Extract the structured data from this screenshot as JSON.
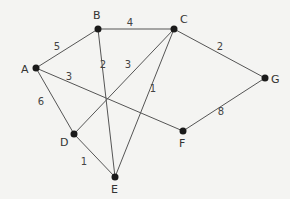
{
  "graph": {
    "nodes": [
      {
        "id": "A",
        "x": 36,
        "y": 68,
        "lx": 21,
        "ly": 73
      },
      {
        "id": "B",
        "x": 98,
        "y": 29,
        "lx": 93,
        "ly": 19
      },
      {
        "id": "C",
        "x": 174,
        "y": 29,
        "lx": 180,
        "ly": 23
      },
      {
        "id": "G",
        "x": 265,
        "y": 78,
        "lx": 271,
        "ly": 83
      },
      {
        "id": "D",
        "x": 74,
        "y": 134,
        "lx": 60,
        "ly": 146
      },
      {
        "id": "E",
        "x": 115,
        "y": 177,
        "lx": 111,
        "ly": 193
      },
      {
        "id": "F",
        "x": 183,
        "y": 131,
        "lx": 179,
        "ly": 147
      }
    ],
    "edges": [
      {
        "from": "A",
        "to": "B",
        "weight": "5",
        "wx": 57,
        "wy": 50
      },
      {
        "from": "B",
        "to": "C",
        "weight": "4",
        "wx": 130,
        "wy": 26
      },
      {
        "from": "C",
        "to": "G",
        "weight": "2",
        "wx": 220,
        "wy": 50
      },
      {
        "from": "A",
        "to": "F",
        "weight": "3",
        "wx": 69,
        "wy": 80
      },
      {
        "from": "A",
        "to": "D",
        "weight": "6",
        "wx": 41,
        "wy": 105
      },
      {
        "from": "B",
        "to": "E",
        "weight": "2",
        "wx": 103,
        "wy": 68
      },
      {
        "from": "D",
        "to": "C",
        "weight": "3",
        "wx": 128,
        "wy": 68
      },
      {
        "from": "C",
        "to": "E",
        "weight": "1",
        "wx": 153,
        "wy": 92
      },
      {
        "from": "D",
        "to": "E",
        "weight": "1",
        "wx": 84,
        "wy": 165
      },
      {
        "from": "F",
        "to": "G",
        "weight": "8",
        "wx": 221,
        "wy": 115
      }
    ]
  }
}
